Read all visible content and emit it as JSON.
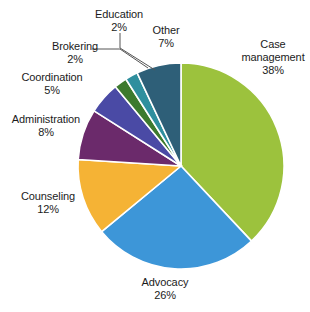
{
  "chart_data": {
    "type": "pie",
    "title": "",
    "legend_position": "none",
    "labels_on_slices": false,
    "start_angle_deg": 0,
    "direction": "clockwise",
    "categories": [
      "Case management",
      "Advocacy",
      "Counseling",
      "Administration",
      "Coordination",
      "Brokering",
      "Education",
      "Other"
    ],
    "values": [
      38,
      26,
      12,
      8,
      5,
      2,
      2,
      7
    ],
    "units": "%",
    "colors": [
      "#9cc23d",
      "#3d96d8",
      "#f5b335",
      "#6b2a6b",
      "#4a4aa5",
      "#3d7a2e",
      "#2f8f9e",
      "#2e5f78"
    ],
    "slices": [
      {
        "label": "Case management",
        "value": 38,
        "display": "38%",
        "color": "#9cc23d",
        "has_leader_line": false
      },
      {
        "label": "Advocacy",
        "value": 26,
        "display": "26%",
        "color": "#3d96d8",
        "has_leader_line": false
      },
      {
        "label": "Counseling",
        "value": 12,
        "display": "12%",
        "color": "#f5b335",
        "has_leader_line": false
      },
      {
        "label": "Administration",
        "value": 8,
        "display": "8%",
        "color": "#6b2a6b",
        "has_leader_line": false
      },
      {
        "label": "Coordination",
        "value": 5,
        "display": "5%",
        "color": "#4a4aa5",
        "has_leader_line": false
      },
      {
        "label": "Brokering",
        "value": 2,
        "display": "2%",
        "color": "#3d7a2e",
        "has_leader_line": true
      },
      {
        "label": "Education",
        "value": 2,
        "display": "2%",
        "color": "#2f8f9e",
        "has_leader_line": true
      },
      {
        "label": "Other",
        "value": 7,
        "display": "7%",
        "color": "#2e5f78",
        "has_leader_line": false
      }
    ]
  },
  "labels": {
    "case_management": {
      "name": "Case management",
      "pct": "38%"
    },
    "advocacy": {
      "name": "Advocacy",
      "pct": "26%"
    },
    "counseling": {
      "name": "Counseling",
      "pct": "12%"
    },
    "administration": {
      "name": "Administration",
      "pct": "8%"
    },
    "coordination": {
      "name": "Coordination",
      "pct": "5%"
    },
    "brokering": {
      "name": "Brokering",
      "pct": "2%"
    },
    "education": {
      "name": "Education",
      "pct": "2%"
    },
    "other": {
      "name": "Other",
      "pct": "7%"
    }
  },
  "style": {
    "background": "#ffffff",
    "text_color": "#1b1b1b",
    "slice_border": "#ffffff",
    "leader_line_color": "#555555"
  }
}
